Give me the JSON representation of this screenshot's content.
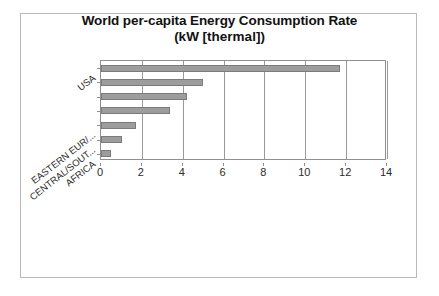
{
  "chart_data": {
    "type": "bar",
    "orientation": "horizontal",
    "title": "World per-capita Energy Consumption Rate",
    "subtitle": "(kW [thermal])",
    "xlabel": "",
    "ylabel": "",
    "xlim": [
      0,
      14
    ],
    "xticks": [
      0,
      2,
      4,
      6,
      8,
      10,
      12,
      14
    ],
    "xticklabels": [
      "0",
      "2",
      "4",
      "6",
      "8",
      "10",
      "12",
      "14"
    ],
    "grid": true,
    "legend": false,
    "categories": [
      "USA",
      "",
      "",
      "",
      "EASTERN EUR/...",
      "CENTRAL/SOUT...",
      "AFRICA"
    ],
    "visible_category_labels": [
      {
        "text": "USA",
        "index": 0
      },
      {
        "text": "EASTERN EUR/...",
        "index": 4
      },
      {
        "text": "CENTRAL/SOUT...",
        "index": 5
      },
      {
        "text": "AFRICA",
        "index": 6
      }
    ],
    "values": [
      11.7,
      5.0,
      4.2,
      3.4,
      1.7,
      1.05,
      0.5
    ],
    "bar_color": "#9d9d9d",
    "bar_edge_color": "#7b7b7b",
    "plot_border_color": "#8f8f8f",
    "text_color": "#2b2b2b",
    "background": "#ffffff"
  }
}
